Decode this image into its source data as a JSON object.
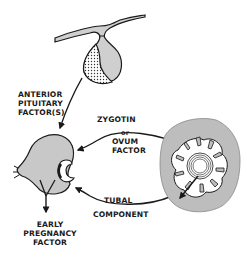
{
  "diagram": {
    "type": "biological-signaling-diagram",
    "nodes": [
      {
        "id": "pituitary",
        "label": "Anterior pituitary (hypothalamus-pituitary)"
      },
      {
        "id": "ovary",
        "label": "Ovary / corpus luteum"
      },
      {
        "id": "embryo",
        "label": "Zygote / ovum in tube"
      }
    ],
    "labels": {
      "anterior_pituitary_line1": "ANTERIOR",
      "anterior_pituitary_line2": "PITUITARY",
      "anterior_pituitary_line3": "FACTOR(S)",
      "zygotin": "ZYGOTIN",
      "or": "or",
      "ovum": "OVUM",
      "factor": "FACTOR",
      "tubal": "TUBAL",
      "component": "COMPONENT",
      "early": "EARLY",
      "pregnancy": "PREGNANCY",
      "epf_factor": "FACTOR"
    },
    "edges": [
      {
        "from": "pituitary",
        "to": "ovary",
        "label": "ANTERIOR PITUITARY FACTOR(S)"
      },
      {
        "from": "embryo",
        "to": "ovary",
        "label": "ZYGOTIN or OVUM FACTOR"
      },
      {
        "from": "embryo",
        "to": "ovary",
        "label": "TUBAL COMPONENT"
      },
      {
        "from": "ovary",
        "to": "output",
        "label": "EARLY PREGNANCY FACTOR"
      }
    ],
    "colors": {
      "line": "#1a1a1a",
      "fill_gray": "#c8c8c8",
      "fill_light": "#d9d9d9",
      "background": "#ffffff"
    }
  }
}
